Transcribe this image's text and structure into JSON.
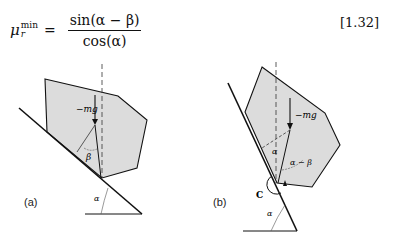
{
  "equation": {
    "symbol": "μ",
    "superscript": "min",
    "subscript": "r",
    "equals": "=",
    "numerator": "sin(α − β)",
    "denominator": "cos(α)",
    "number": "[1.32]"
  },
  "figure_a": {
    "label": "(a)",
    "force_label": "−mg",
    "angle_beta": "β",
    "angle_alpha": "α"
  },
  "figure_b": {
    "label": "(b)",
    "force_label": "−mg",
    "angle_alpha_inner": "α",
    "angle_alpha_minus_beta": "α − β",
    "contact_label": "C",
    "angle_alpha": "α"
  },
  "colors": {
    "block_fill": "#dcdcdc",
    "line": "#111111"
  }
}
